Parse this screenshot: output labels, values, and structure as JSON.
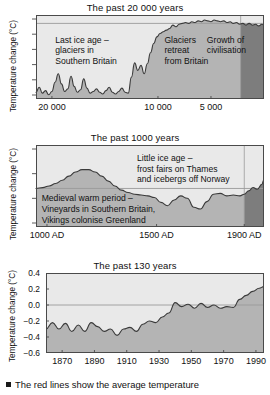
{
  "figure": {
    "caption": "The red lines show the average temperature",
    "caption_bullet": "square-bullet"
  },
  "colors": {
    "fill_gray": "#b4b4b4",
    "fill_dark": "#7d7d7d",
    "plot_bg": "#e9e9e9",
    "frame": "#4a4a4a",
    "curve": "#3a3a3a",
    "zero_line": "#9a9a9a",
    "text": "#111111"
  },
  "chart_data": [
    {
      "id": "past-20000-years",
      "type": "area",
      "title": "The past 20 000 years",
      "ylabel": "Temperature change (°C)",
      "xlabel": "",
      "xticks": [
        20000,
        10000,
        5000
      ],
      "xticklabels": [
        "20 000",
        "10 000",
        "5 000"
      ],
      "xlim": [
        21500,
        0
      ],
      "ylim": [
        0,
        1
      ],
      "yticklabels": [],
      "ytick_count": 6,
      "grid": false,
      "highlight_region": {
        "from": 2200,
        "to": 0,
        "label": "industrial-era-band"
      },
      "annotations": [
        {
          "text": "Last ice age –\nglaciers in\nSouthern Britain",
          "x": 19500,
          "y": 0.72
        },
        {
          "text": "Glaciers\nretreat\nfrom Britain",
          "x": 9200,
          "y": 0.72
        },
        {
          "text": "Growth of\ncivilisation",
          "x": 5200,
          "y": 0.72
        }
      ],
      "x": [
        21500,
        21200,
        20900,
        20600,
        20300,
        20000,
        19700,
        19400,
        19100,
        18800,
        18500,
        18200,
        17900,
        17600,
        17300,
        17000,
        16700,
        16400,
        16100,
        15800,
        15500,
        15200,
        14900,
        14600,
        14300,
        14000,
        13700,
        13400,
        13100,
        12800,
        12500,
        12200,
        11900,
        11600,
        11300,
        11000,
        10700,
        10400,
        10100,
        9800,
        9500,
        9200,
        8900,
        8600,
        8300,
        8000,
        7700,
        7400,
        7100,
        6800,
        6500,
        6200,
        5900,
        5600,
        5300,
        5000,
        4700,
        4400,
        4100,
        3800,
        3500,
        3200,
        2900,
        2600,
        2300,
        2000,
        1700,
        1400,
        1100,
        800,
        500,
        200,
        0
      ],
      "y": [
        0.08,
        0.14,
        0.07,
        0.1,
        0.05,
        0.09,
        0.2,
        0.3,
        0.18,
        0.09,
        0.12,
        0.27,
        0.15,
        0.08,
        0.11,
        0.24,
        0.13,
        0.07,
        0.09,
        0.12,
        0.08,
        0.06,
        0.1,
        0.14,
        0.08,
        0.06,
        0.09,
        0.13,
        0.08,
        0.07,
        0.26,
        0.43,
        0.34,
        0.4,
        0.3,
        0.42,
        0.55,
        0.66,
        0.74,
        0.78,
        0.8,
        0.82,
        0.84,
        0.88,
        0.86,
        0.89,
        0.9,
        0.91,
        0.9,
        0.92,
        0.91,
        0.93,
        0.92,
        0.94,
        0.93,
        0.92,
        0.94,
        0.93,
        0.92,
        0.93,
        0.91,
        0.92,
        0.9,
        0.91,
        0.89,
        0.9,
        0.88,
        0.9,
        0.88,
        0.89,
        0.87,
        0.89,
        0.88
      ]
    },
    {
      "id": "past-1000-years",
      "type": "area",
      "title": "The past 1000 years",
      "ylabel": "Temperature change (°C)",
      "xlabel": "",
      "xticks": [
        1000,
        1500,
        1900
      ],
      "xticklabels": [
        "1000 AD",
        "1500 AD",
        "1900 AD"
      ],
      "xlim": [
        950,
        1990
      ],
      "ylim": [
        0,
        1
      ],
      "yticklabels": [],
      "ytick_count": 4,
      "grid": false,
      "zero_line_y": 0.47,
      "highlight_region": {
        "from": 1900,
        "to": 1990,
        "label": "modern-era-band"
      },
      "annotations": [
        {
          "text": "Little ice age –\nfrost fairs on Thames\nand icebergs off Norway",
          "x": 1420,
          "y": 0.85
        },
        {
          "text": "Medieval warm period –\nVineyards in Southern Britain,\nVikings colonise Greenland",
          "x": 985,
          "y": 0.36
        }
      ],
      "x": [
        950,
        980,
        1010,
        1040,
        1070,
        1100,
        1130,
        1160,
        1190,
        1220,
        1250,
        1280,
        1310,
        1340,
        1370,
        1400,
        1430,
        1460,
        1490,
        1520,
        1550,
        1580,
        1610,
        1640,
        1670,
        1700,
        1730,
        1760,
        1790,
        1820,
        1850,
        1880,
        1900,
        1920,
        1940,
        1960,
        1980,
        1990
      ],
      "y": [
        0.47,
        0.48,
        0.5,
        0.53,
        0.57,
        0.62,
        0.67,
        0.7,
        0.7,
        0.67,
        0.62,
        0.56,
        0.5,
        0.45,
        0.42,
        0.4,
        0.39,
        0.38,
        0.36,
        0.3,
        0.26,
        0.33,
        0.38,
        0.35,
        0.24,
        0.22,
        0.31,
        0.4,
        0.41,
        0.38,
        0.39,
        0.38,
        0.4,
        0.44,
        0.48,
        0.46,
        0.52,
        0.58
      ]
    },
    {
      "id": "past-130-years",
      "type": "area",
      "title": "The past 130 years",
      "ylabel": "Temperature change (°C)",
      "xlabel": "",
      "xticks": [
        1870,
        1890,
        1910,
        1930,
        1950,
        1970,
        1990
      ],
      "xticklabels": [
        "1870",
        "1890",
        "1910",
        "1930",
        "1950",
        "1970",
        "1990"
      ],
      "xlim": [
        1860,
        1995
      ],
      "ylim": [
        -0.6,
        0.4
      ],
      "yticks": [
        0.4,
        0.2,
        0.0,
        -0.2,
        -0.4,
        -0.6
      ],
      "yticklabels": [
        "0.4",
        "0.2",
        "0.0",
        "−0.2",
        "−0.4",
        "−0.6"
      ],
      "grid": false,
      "zero_line_value": 0.0,
      "x": [
        1860,
        1864,
        1868,
        1872,
        1876,
        1880,
        1884,
        1888,
        1892,
        1896,
        1900,
        1904,
        1908,
        1912,
        1916,
        1920,
        1924,
        1928,
        1932,
        1936,
        1940,
        1944,
        1948,
        1952,
        1956,
        1960,
        1964,
        1968,
        1972,
        1976,
        1980,
        1984,
        1988,
        1992,
        1995
      ],
      "y": [
        -0.3,
        -0.22,
        -0.3,
        -0.23,
        -0.33,
        -0.25,
        -0.33,
        -0.22,
        -0.27,
        -0.33,
        -0.3,
        -0.38,
        -0.3,
        -0.28,
        -0.33,
        -0.24,
        -0.2,
        -0.22,
        -0.15,
        -0.1,
        0.03,
        -0.02,
        0.01,
        -0.04,
        0.02,
        -0.03,
        0.0,
        -0.04,
        -0.02,
        -0.03,
        0.07,
        0.12,
        0.17,
        0.21,
        0.23
      ]
    }
  ]
}
